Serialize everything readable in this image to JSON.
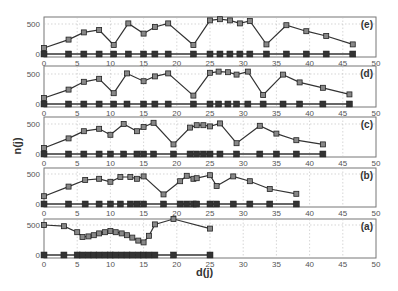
{
  "chart_data": {
    "type": "line",
    "title": "",
    "xlabel": "d(j)",
    "ylabel": "n(j)",
    "xlim": [
      0,
      50
    ],
    "ylim": [
      0,
      600
    ],
    "x_ticks": [
      0,
      5,
      10,
      15,
      20,
      25,
      30,
      35,
      40,
      45,
      50
    ],
    "y_ticks": [
      0,
      500
    ],
    "grid": true,
    "panels": [
      {
        "label": "(e)",
        "series": [
          {
            "name": "n(j)",
            "marker": "open-square",
            "x": [
              0,
              3.7,
              6,
              8.3,
              10.5,
              12.7,
              15,
              16.7,
              18.7,
              22.5,
              25,
              26.5,
              28,
              29.5,
              31,
              33.5,
              36.5,
              39.5,
              42.5,
              46.5
            ],
            "y": [
              100,
              240,
              360,
              400,
              150,
              510,
              340,
              450,
              510,
              150,
              560,
              580,
              560,
              510,
              550,
              160,
              480,
              380,
              300,
              160
            ]
          },
          {
            "name": "baseline",
            "marker": "filled-square",
            "x": [
              0,
              3.7,
              6,
              8.3,
              10.5,
              12.7,
              15,
              16.7,
              18.7,
              22.5,
              25,
              26.5,
              28,
              29.5,
              31,
              33.5,
              36.5,
              39.5,
              42.5,
              46.5
            ],
            "y": [
              0,
              0,
              0,
              0,
              0,
              0,
              0,
              0,
              0,
              0,
              0,
              0,
              0,
              0,
              0,
              0,
              0,
              0,
              0,
              0
            ]
          }
        ]
      },
      {
        "label": "(d)",
        "series": [
          {
            "name": "n(j)",
            "marker": "open-square",
            "x": [
              0,
              3.7,
              6,
              8.3,
              10.5,
              12.5,
              15,
              16.7,
              18.7,
              22.5,
              25,
              26.3,
              27.7,
              29,
              30.7,
              33,
              36,
              38.5,
              42,
              46
            ],
            "y": [
              100,
              240,
              370,
              420,
              180,
              510,
              380,
              460,
              510,
              140,
              520,
              540,
              530,
              490,
              540,
              150,
              490,
              360,
              270,
              160
            ]
          },
          {
            "name": "baseline",
            "marker": "filled-square",
            "x": [
              0,
              3.7,
              6,
              8.3,
              10.5,
              12.5,
              15,
              16.7,
              18.7,
              22.5,
              25,
              26.3,
              27.7,
              29,
              30.7,
              33,
              36,
              38.5,
              42,
              46
            ],
            "y": [
              0,
              0,
              0,
              0,
              0,
              0,
              0,
              0,
              0,
              0,
              0,
              0,
              0,
              0,
              0,
              0,
              0,
              0,
              0,
              0
            ]
          }
        ]
      },
      {
        "label": "(c)",
        "series": [
          {
            "name": "n(j)",
            "marker": "open-square",
            "x": [
              0,
              3.7,
              6,
              8.3,
              10,
              12,
              14,
              15,
              16.5,
              19.5,
              22,
              23,
              24,
              25,
              26.5,
              29,
              32.5,
              35,
              38,
              42
            ],
            "y": [
              100,
              260,
              380,
              420,
              320,
              500,
              380,
              450,
              520,
              160,
              440,
              480,
              480,
              460,
              510,
              180,
              470,
              340,
              230,
              160
            ]
          },
          {
            "name": "baseline",
            "marker": "filled-square",
            "x": [
              0,
              3.7,
              6,
              8.3,
              10,
              12,
              14,
              15,
              16.5,
              19.5,
              22,
              23,
              24,
              25,
              26.5,
              29,
              32.5,
              35,
              38,
              42
            ],
            "y": [
              0,
              0,
              0,
              0,
              0,
              0,
              0,
              0,
              0,
              0,
              0,
              0,
              0,
              0,
              0,
              0,
              0,
              0,
              0,
              0
            ]
          }
        ]
      },
      {
        "label": "(b)",
        "series": [
          {
            "name": "n(j)",
            "marker": "open-square",
            "x": [
              0,
              3.7,
              6.2,
              8.3,
              10,
              11.5,
              13,
              14,
              15,
              18,
              20.5,
              21.5,
              22.5,
              23,
              25,
              26,
              28.5,
              31,
              34,
              38
            ],
            "y": [
              130,
              290,
              400,
              420,
              370,
              450,
              450,
              420,
              460,
              160,
              380,
              470,
              420,
              430,
              480,
              300,
              460,
              380,
              250,
              170
            ]
          },
          {
            "name": "baseline",
            "marker": "filled-square",
            "x": [
              0,
              3.7,
              6.2,
              8.3,
              10,
              11.5,
              13,
              14,
              15,
              18,
              20.5,
              21.5,
              22.5,
              23,
              25,
              26,
              28.5,
              31,
              34,
              38
            ],
            "y": [
              0,
              0,
              0,
              0,
              0,
              0,
              0,
              0,
              0,
              0,
              0,
              0,
              0,
              0,
              0,
              0,
              0,
              0,
              0,
              0
            ]
          }
        ]
      },
      {
        "label": "(a)",
        "series": [
          {
            "name": "n(j)",
            "marker": "open-square",
            "x": [
              0,
              3,
              5,
              5.8,
              6.7,
              7.5,
              8.3,
              9.2,
              10,
              10.8,
              11.7,
              12.5,
              13.3,
              14.2,
              15,
              15.8,
              16.7,
              19.5,
              25
            ],
            "y": [
              500,
              480,
              380,
              300,
              310,
              330,
              360,
              380,
              400,
              380,
              360,
              330,
              290,
              240,
              210,
              320,
              510,
              600,
              440
            ]
          },
          {
            "name": "baseline",
            "marker": "filled-square",
            "x": [
              0,
              3,
              5,
              5.8,
              6.7,
              7.5,
              8.3,
              9.2,
              10,
              10.8,
              11.7,
              12.5,
              13.3,
              14.2,
              15,
              15.8,
              16.7,
              19.5,
              25
            ],
            "y": [
              0,
              0,
              0,
              0,
              0,
              0,
              0,
              0,
              0,
              0,
              0,
              0,
              0,
              0,
              0,
              0,
              0,
              0,
              0
            ]
          }
        ]
      }
    ]
  },
  "axes": {
    "xlabel": "d(j)",
    "ylabel": "n(j)",
    "x_tick_labels": [
      "0",
      "5",
      "10",
      "15",
      "20",
      "25",
      "30",
      "35",
      "40",
      "45",
      "50"
    ],
    "y_tick_labels": {
      "zero": "0",
      "top": "500"
    }
  }
}
